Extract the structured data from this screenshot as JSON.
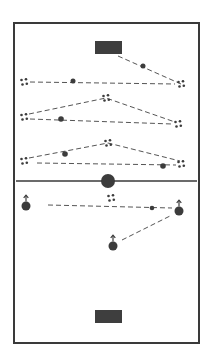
{
  "diagram": {
    "type": "soccer-training-drill",
    "background": "#ffffff",
    "colors": {
      "line": "#3a3a3a",
      "dashed": "#555555",
      "fill": "#3c3c3c",
      "goal": "#3e3e3e"
    },
    "field": {
      "x": 14,
      "y": 23,
      "width": 185,
      "height": 320
    },
    "halfway_line": {
      "y": 181,
      "x1": 16,
      "x2": 197
    },
    "center_ball": {
      "cx": 108,
      "cy": 181,
      "r": 7
    },
    "goals": [
      {
        "id": "top-goal",
        "x": 95,
        "y": 41,
        "width": 27,
        "height": 13
      },
      {
        "id": "bottom-goal",
        "x": 95,
        "y": 310,
        "width": 27,
        "height": 13
      }
    ],
    "cones": [
      {
        "id": "cone-r1-left",
        "cx": 24,
        "cy": 82
      },
      {
        "id": "cone-r1-right",
        "cx": 181,
        "cy": 84
      },
      {
        "id": "cone-r2-left",
        "cx": 24,
        "cy": 117
      },
      {
        "id": "cone-r2-mid",
        "cx": 106,
        "cy": 98
      },
      {
        "id": "cone-r2-right",
        "cx": 178,
        "cy": 124
      },
      {
        "id": "cone-r3-left",
        "cx": 24,
        "cy": 161
      },
      {
        "id": "cone-r3-mid",
        "cx": 108,
        "cy": 143
      },
      {
        "id": "cone-r3-right",
        "cx": 181,
        "cy": 164
      },
      {
        "id": "cone-bottom-mid",
        "cx": 111,
        "cy": 198
      }
    ],
    "balls": [
      {
        "id": "ball-r1-diag",
        "cx": 143,
        "cy": 66,
        "r": 2.5
      },
      {
        "id": "ball-r1-line",
        "cx": 73,
        "cy": 81,
        "r": 2.5
      },
      {
        "id": "ball-r2-line",
        "cx": 61,
        "cy": 119,
        "r": 2.8
      },
      {
        "id": "ball-r3-upper",
        "cx": 65,
        "cy": 154,
        "r": 2.8
      },
      {
        "id": "ball-r3-lower",
        "cx": 163,
        "cy": 166,
        "r": 2.8
      },
      {
        "id": "ball-bottom-line",
        "cx": 152,
        "cy": 208,
        "r": 2.3
      }
    ],
    "players": [
      {
        "id": "player-left",
        "cx": 26,
        "cy": 206,
        "r": 4.5
      },
      {
        "id": "player-right",
        "cx": 179,
        "cy": 211,
        "r": 4.5
      },
      {
        "id": "player-center",
        "cx": 113,
        "cy": 246,
        "r": 4.5
      }
    ],
    "dashed_paths": [
      {
        "id": "path-goal-to-r1-right",
        "points": "118,56 181,84"
      },
      {
        "id": "path-r1-line",
        "points": "30,82 175,84"
      },
      {
        "id": "path-r2-upper",
        "points": "29,114 106,98 175,122"
      },
      {
        "id": "path-r2-lower",
        "points": "30,119 172,124"
      },
      {
        "id": "path-r3-upper",
        "points": "29,158 108,143 180,161"
      },
      {
        "id": "path-r3-lower",
        "points": "37,163 176,165"
      },
      {
        "id": "path-bottom-line",
        "points": "48,205 172,208"
      },
      {
        "id": "path-bottom-diag",
        "points": "122,240 170,216"
      }
    ]
  }
}
